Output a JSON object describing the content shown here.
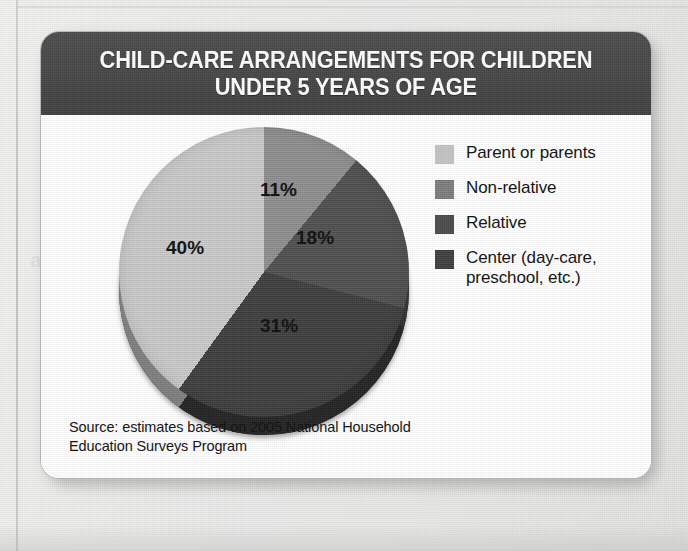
{
  "figure": {
    "title": "CHILD-CARE ARRANGEMENTS FOR CHILDREN\nUNDER 5 YEARS OF AGE",
    "source_note": "Source: estimates based on 2005 National Household\nEducation Surveys Program"
  },
  "ghost_text": "and\n25\nD R",
  "chart_data": {
    "type": "pie",
    "title": "CHILD-CARE ARRANGEMENTS FOR CHILDREN UNDER 5 YEARS OF AGE",
    "xlabel": "",
    "ylabel": "",
    "legend_position": "right",
    "start_angle_deg": 0,
    "direction": "clockwise",
    "categories": [
      "Non-relative",
      "Relative",
      "Center (day-care, preschool, etc.)",
      "Parent or parents"
    ],
    "values": [
      11,
      18,
      31,
      40
    ],
    "labels": [
      "11%",
      "18%",
      "31%",
      "40%"
    ],
    "units": "percent",
    "slices": [
      {
        "label": "11%",
        "value": 11,
        "category": "Non-relative",
        "color": "#8f8f8f"
      },
      {
        "label": "18%",
        "value": 18,
        "category": "Relative",
        "color": "#4e4e4e"
      },
      {
        "label": "31%",
        "value": 31,
        "category": "Center (day-care, preschool, etc.)",
        "color": "#3c3c3c"
      },
      {
        "label": "40%",
        "value": 40,
        "category": "Parent or parents",
        "color": "#cdcdcd"
      }
    ]
  },
  "legend": {
    "items": [
      {
        "label": "Parent or parents",
        "color": "#c8c8c8"
      },
      {
        "label": "Non-relative",
        "color": "#7e7e7e"
      },
      {
        "label": "Relative",
        "color": "#4a4a4a"
      },
      {
        "label": "Center (day-care,\npreschool, etc.)",
        "color": "#3d3d3d"
      }
    ]
  },
  "colors": {
    "header_bar": "#474747",
    "card_background": "#ffffff",
    "page_background": "#ececea",
    "title_text": "#ffffff",
    "body_text": "#101010"
  }
}
